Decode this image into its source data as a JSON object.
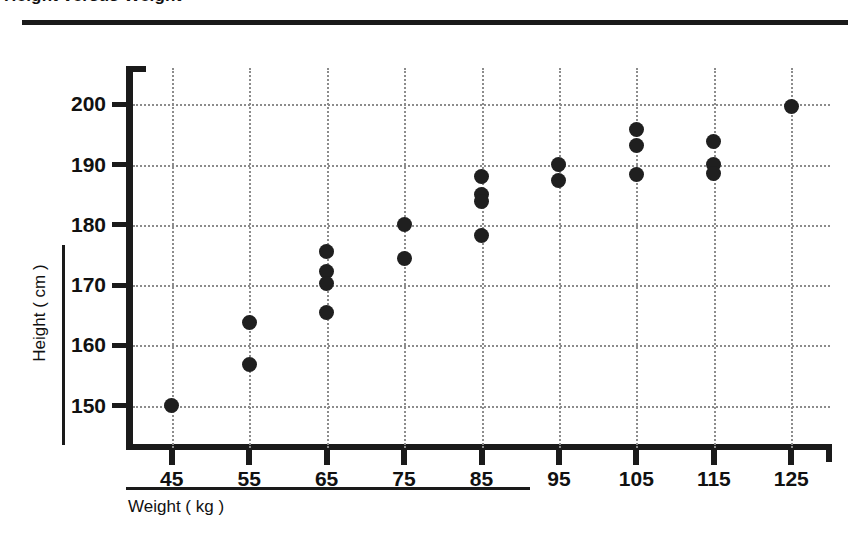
{
  "page": {
    "title_partial": "Height versus Weight",
    "background_color": "#ffffff",
    "ink_color": "#1a1a1a",
    "grid_color": "#8c8c8c"
  },
  "chart_data": {
    "type": "scatter",
    "title": "Height versus Weight",
    "xlabel": "Weight ( kg )",
    "ylabel": "Height ( cm )",
    "xlim": [
      40,
      130
    ],
    "ylim": [
      143,
      206
    ],
    "xticks": [
      45,
      55,
      65,
      75,
      85,
      95,
      105,
      115,
      125
    ],
    "yticks": [
      150,
      160,
      170,
      180,
      190,
      200
    ],
    "grid": true,
    "grid_style": "dotted",
    "legend": "none",
    "marker": "filled-circle",
    "marker_color": "#1f1f1f",
    "points": [
      {
        "x": 45,
        "y": 150.0
      },
      {
        "x": 55,
        "y": 163.8
      },
      {
        "x": 55,
        "y": 156.8
      },
      {
        "x": 65,
        "y": 175.5
      },
      {
        "x": 65,
        "y": 172.3
      },
      {
        "x": 65,
        "y": 170.3
      },
      {
        "x": 65,
        "y": 165.5
      },
      {
        "x": 75,
        "y": 180.0
      },
      {
        "x": 75,
        "y": 174.5
      },
      {
        "x": 85,
        "y": 188.0
      },
      {
        "x": 85,
        "y": 185.0
      },
      {
        "x": 85,
        "y": 183.8
      },
      {
        "x": 85,
        "y": 178.2
      },
      {
        "x": 95,
        "y": 190.0
      },
      {
        "x": 95,
        "y": 187.3
      },
      {
        "x": 105,
        "y": 195.8
      },
      {
        "x": 105,
        "y": 193.2
      },
      {
        "x": 105,
        "y": 188.3
      },
      {
        "x": 115,
        "y": 193.8
      },
      {
        "x": 115,
        "y": 190.0
      },
      {
        "x": 115,
        "y": 188.5
      },
      {
        "x": 125,
        "y": 199.7
      }
    ]
  }
}
